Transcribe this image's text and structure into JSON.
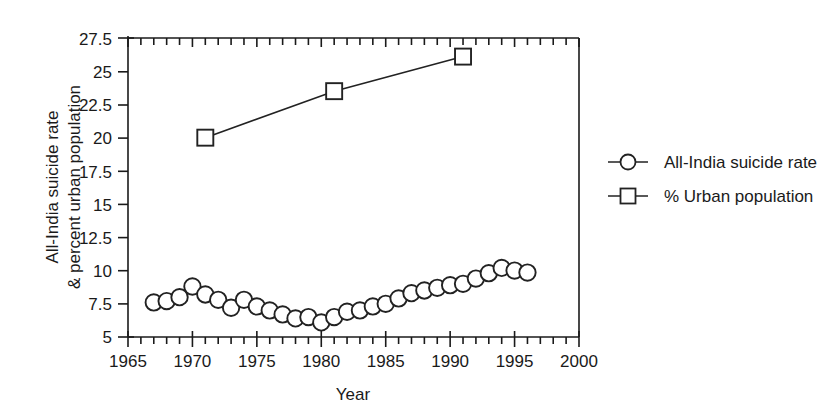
{
  "chart_data": {
    "type": "line",
    "title": "",
    "subtitle": "",
    "xlabel": "Year",
    "ylabel": "All-India suicide rate & percent urban population",
    "ylabel_line1": "All-India suicide rate",
    "ylabel_line2": "& percent urban population",
    "xlim": [
      1965,
      2000
    ],
    "ylim": [
      5,
      27.5
    ],
    "xticks": [
      1965,
      1970,
      1975,
      1980,
      1985,
      1990,
      1995,
      2000
    ],
    "xticklabels": [
      "1965",
      "1970",
      "1975",
      "1980",
      "1985",
      "1990",
      "1995",
      "2000"
    ],
    "xminorticks": [
      1966,
      1967,
      1968,
      1969,
      1971,
      1972,
      1973,
      1974,
      1976,
      1977,
      1978,
      1979,
      1981,
      1982,
      1983,
      1984,
      1986,
      1987,
      1988,
      1989,
      1991,
      1992,
      1993,
      1994,
      1996,
      1997,
      1998,
      1999
    ],
    "yticks": [
      5,
      7.5,
      10,
      12.5,
      15,
      17.5,
      20,
      22.5,
      25,
      27.5
    ],
    "yticklabels": [
      "5",
      "7.5",
      "10",
      "12.5",
      "15",
      "17.5",
      "20",
      "22.5",
      "25",
      "27.5"
    ],
    "grid": false,
    "legend_position": "right",
    "series": [
      {
        "name": "All-India suicide rate",
        "marker": "circle",
        "color": "#222222",
        "x": [
          1967,
          1968,
          1969,
          1970,
          1971,
          1972,
          1973,
          1974,
          1975,
          1976,
          1977,
          1978,
          1979,
          1980,
          1981,
          1982,
          1983,
          1984,
          1985,
          1986,
          1987,
          1988,
          1989,
          1990,
          1991,
          1992,
          1993,
          1994,
          1995,
          1996
        ],
        "values": [
          7.6,
          7.7,
          8.0,
          8.8,
          8.2,
          7.8,
          7.2,
          7.8,
          7.3,
          7.0,
          6.7,
          6.4,
          6.5,
          6.1,
          6.5,
          6.9,
          7.0,
          7.3,
          7.5,
          7.9,
          8.3,
          8.5,
          8.7,
          8.9,
          9.0,
          9.4,
          9.8,
          10.2,
          10.0,
          9.85
        ]
      },
      {
        "name": "% Urban population",
        "marker": "square",
        "color": "#222222",
        "x": [
          1971,
          1981,
          1991
        ],
        "values": [
          20.0,
          23.5,
          26.1
        ]
      }
    ]
  },
  "legend": {
    "entries": [
      {
        "label": "All-India suicide rate",
        "marker": "circle"
      },
      {
        "label": "% Urban population",
        "marker": "square"
      }
    ]
  }
}
